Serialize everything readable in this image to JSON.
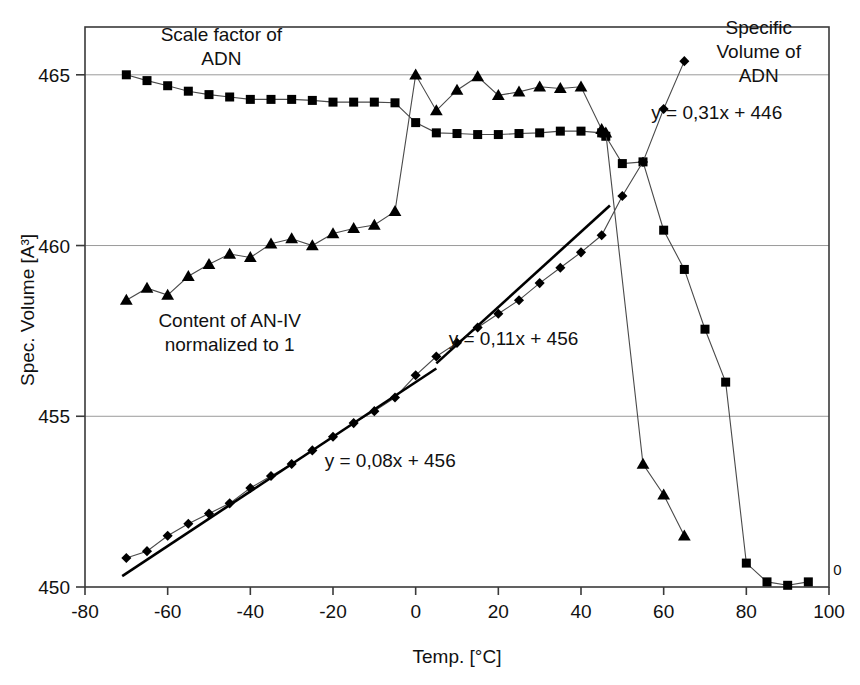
{
  "chart_data": {
    "type": "line",
    "title": "",
    "xlabel": "Temp. [°C]",
    "ylabel": "Spec. Volume [A³]",
    "xlim": [
      -80,
      100
    ],
    "ylim": [
      450,
      466.4
    ],
    "xticks": [
      -80,
      -60,
      -40,
      -20,
      0,
      20,
      40,
      60,
      80,
      100
    ],
    "xticklabels": [
      "-80",
      "-60",
      "-40",
      "-20",
      "0",
      "20",
      "40",
      "60",
      "80",
      "100"
    ],
    "yticks": [
      450,
      455,
      460,
      465
    ],
    "yticklabels": [
      "450",
      "455",
      "460",
      "465"
    ],
    "grid": "horizontal",
    "legend_position": "none",
    "marker_color": "#000000",
    "line_color": "#4a4a4a",
    "fit_line_color": "#000000",
    "series": [
      {
        "name": "Scale factor of ADN",
        "marker": "square",
        "x": [
          -70,
          -65,
          -60,
          -55,
          -50,
          -45,
          -40,
          -35,
          -30,
          -25,
          -20,
          -15,
          -10,
          -5,
          0,
          5,
          10,
          15,
          20,
          25,
          30,
          35,
          40,
          45,
          46,
          50,
          55,
          60,
          65,
          70,
          75,
          80,
          85,
          90,
          95
        ],
        "y": [
          465.0,
          464.83,
          464.68,
          464.52,
          464.42,
          464.35,
          464.28,
          464.28,
          464.28,
          464.25,
          464.2,
          464.2,
          464.2,
          464.18,
          463.6,
          463.3,
          463.28,
          463.25,
          463.25,
          463.28,
          463.3,
          463.35,
          463.35,
          463.3,
          463.2,
          462.4,
          462.45,
          460.45,
          459.3,
          457.55,
          456.0,
          450.7,
          450.15,
          450.05,
          450.15
        ]
      },
      {
        "name": "Content of AN-IV normalized to 1",
        "marker": "triangle",
        "x": [
          -70,
          -65,
          -60,
          -55,
          -50,
          -45,
          -40,
          -35,
          -30,
          -25,
          -20,
          -15,
          -10,
          -5,
          0,
          5,
          10,
          15,
          20,
          25,
          30,
          35,
          40,
          45,
          46,
          55,
          60,
          65
        ],
        "y": [
          458.4,
          458.75,
          458.55,
          459.1,
          459.45,
          459.75,
          459.65,
          460.05,
          460.2,
          460.0,
          460.35,
          460.5,
          460.6,
          461.0,
          465.0,
          463.95,
          464.55,
          464.95,
          464.4,
          464.5,
          464.65,
          464.6,
          464.65,
          463.4,
          463.3,
          453.6,
          452.7,
          451.5
        ]
      },
      {
        "name": "Specific Volume of ADN",
        "marker": "diamond",
        "x": [
          -70,
          -65,
          -60,
          -55,
          -50,
          -45,
          -40,
          -35,
          -30,
          -25,
          -20,
          -15,
          -10,
          -5,
          0,
          5,
          10,
          15,
          20,
          25,
          30,
          35,
          40,
          45,
          50,
          55,
          60,
          65
        ],
        "y": [
          450.85,
          451.05,
          451.5,
          451.85,
          452.15,
          452.45,
          452.9,
          453.25,
          453.6,
          454.0,
          454.4,
          454.8,
          455.15,
          455.55,
          456.2,
          456.75,
          457.15,
          457.6,
          458.0,
          458.4,
          458.9,
          459.35,
          459.8,
          460.3,
          461.45,
          462.45,
          464.0,
          465.4
        ]
      }
    ],
    "fit_lines": [
      {
        "label": "y = 0,08x + 456",
        "slope": 0.08,
        "intercept": 456,
        "x_start": -71,
        "x_end": 5
      },
      {
        "label": "y = 0,11x + 456",
        "slope": 0.11,
        "intercept": 456,
        "x_start": 5,
        "x_end": 47
      },
      {
        "label": "y = 0,31x + 446",
        "slope": 0.31,
        "intercept": 446,
        "x_start": 47,
        "x_end": 47
      }
    ],
    "annotations": [
      {
        "id": "label-scale-factor",
        "lines": [
          "Scale factor of",
          "ADN"
        ],
        "x": -47,
        "y": 466.0,
        "align": "middle"
      },
      {
        "id": "label-specific-volume",
        "lines": [
          "Specific",
          "Volume of",
          "ADN"
        ],
        "x": 83,
        "y": 466.2,
        "align": "middle"
      },
      {
        "id": "label-content-an-iv",
        "lines": [
          "Content of AN-IV",
          "normalized to 1"
        ],
        "x": -45,
        "y": 457.6,
        "align": "middle"
      },
      {
        "id": "eq-008",
        "lines": [
          "y = 0,08x + 456"
        ],
        "x": -22,
        "y": 453.5,
        "align": "start"
      },
      {
        "id": "eq-011",
        "lines": [
          "y = 0,11x + 456"
        ],
        "x": 8,
        "y": 457.1,
        "align": "start"
      },
      {
        "id": "eq-031",
        "lines": [
          "y = 0,31x + 446"
        ],
        "x": 57,
        "y": 463.7,
        "align": "start"
      },
      {
        "id": "zero-marker",
        "lines": [
          "0"
        ],
        "x": 101,
        "y": 450.35,
        "align": "start"
      }
    ]
  }
}
